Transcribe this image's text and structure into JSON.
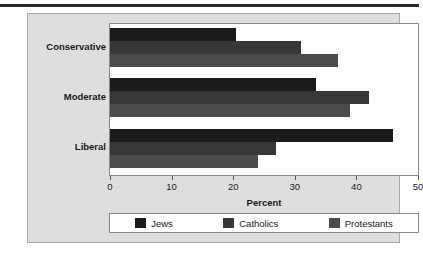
{
  "chart_data": {
    "type": "bar",
    "orientation": "horizontal",
    "title": "",
    "xlabel": "Percent",
    "ylabel": "",
    "xlim": [
      0,
      50
    ],
    "xticks": [
      0,
      10,
      20,
      30,
      40,
      50
    ],
    "xtick_labels": [
      "0",
      "10",
      "20",
      "30",
      "40",
      "50"
    ],
    "categories": [
      "Conservative",
      "Moderate",
      "Liberal"
    ],
    "grid": false,
    "legend_position": "bottom",
    "series": [
      {
        "name": "Jews",
        "color": "#1b1b1b",
        "values": [
          20.5,
          33.5,
          46.0
        ]
      },
      {
        "name": "Catholics",
        "color": "#373737",
        "values": [
          31.0,
          42.0,
          27.0
        ]
      },
      {
        "name": "Protestants",
        "color": "#4b4b4b",
        "values": [
          37.0,
          39.0,
          24.0
        ]
      }
    ]
  },
  "figure": {
    "panel_background": "#dedede",
    "plot_background": "#ffffff",
    "frame_color": "#8a8a8a",
    "top_rule_color": "#2b2b2b"
  }
}
